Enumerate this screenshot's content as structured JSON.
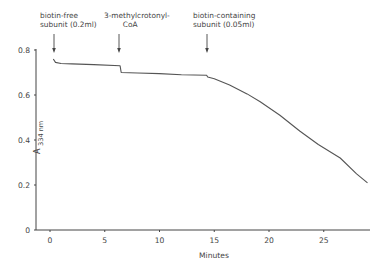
{
  "chart_data": {
    "type": "line",
    "title": "",
    "xlabel": "Minutes",
    "ylabel": "A 334 nm",
    "ylabel_main": "A",
    "ylabel_sub": "334 nm",
    "xlim": [
      -1,
      29
    ],
    "ylim": [
      0,
      0.8
    ],
    "xticks": [
      0,
      5,
      10,
      15,
      20,
      25
    ],
    "yticks": [
      0,
      0.2,
      0.4,
      0.6,
      0.8
    ],
    "xtick_labels": [
      "0",
      "5",
      "10",
      "15",
      "20",
      "25"
    ],
    "ytick_labels": [
      "0",
      "0.2",
      "0.4",
      "0.6",
      "0.8"
    ],
    "grid": false,
    "legend": null,
    "series": [
      {
        "name": "Absorbance at 334 nm",
        "x": [
          0.3,
          0.5,
          1.0,
          2.0,
          4.0,
          6.4,
          6.5,
          8.0,
          10.0,
          12.0,
          14.3,
          14.4,
          15.0,
          16.4,
          18.0,
          19.2,
          21.0,
          22.8,
          24.5,
          26.5,
          28.0,
          29.0
        ],
        "y": [
          0.76,
          0.745,
          0.74,
          0.738,
          0.735,
          0.73,
          0.7,
          0.698,
          0.695,
          0.69,
          0.688,
          0.68,
          0.672,
          0.645,
          0.605,
          0.57,
          0.51,
          0.44,
          0.38,
          0.32,
          0.25,
          0.21
        ]
      }
    ],
    "annotations": [
      {
        "text": "biotin-free\nsubunit (0.2ml)",
        "x": 0.3,
        "arrow": true
      },
      {
        "text": "3-methylcrotonyl-\nCoA",
        "x": 6.5,
        "arrow": true
      },
      {
        "text": "biotin-containing\nsubunit (0.05ml)",
        "x": 14.4,
        "arrow": true
      }
    ]
  },
  "labels": {
    "ann1": "biotin-free\nsubunit (0.2ml)",
    "ann2": "3-methylcrotonyl-\n        CoA",
    "ann3": "biotin-containing\nsubunit (0.05ml)",
    "xlabel": "Minutes",
    "ylabel_main": "A",
    "ylabel_sub": "334 nm"
  },
  "colors": {
    "line": "#555555",
    "axis": "#444444"
  }
}
